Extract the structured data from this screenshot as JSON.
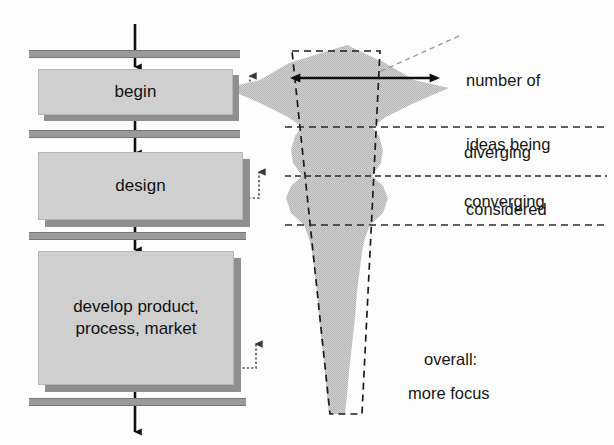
{
  "diagram": {
    "background_color": "#fdfdfd",
    "ink_color": "#1a1a1a",
    "fill_gray": "#cfcfcf",
    "bar_gray": "#9a9a9a",
    "shadow_gray": "#8f8f8f"
  },
  "process": {
    "stages": [
      {
        "id": "begin",
        "label": "begin"
      },
      {
        "id": "design",
        "label": "design"
      },
      {
        "id": "develop",
        "label": "develop product,\nprocess, market",
        "line1": "develop product,",
        "line2": "process, market"
      }
    ],
    "gates": [
      {
        "id": "gate-1"
      },
      {
        "id": "gate-2"
      },
      {
        "id": "gate-3"
      },
      {
        "id": "gate-4"
      }
    ],
    "flow_arrows": [
      {
        "id": "arrow-into-begin"
      },
      {
        "id": "arrow-begin-to-design"
      },
      {
        "id": "arrow-design-to-develop"
      },
      {
        "id": "arrow-out-of-develop"
      }
    ],
    "feedback_loops": [
      {
        "id": "feedback-begin"
      },
      {
        "id": "feedback-design"
      },
      {
        "id": "feedback-develop"
      }
    ]
  },
  "funnel": {
    "measure_arrow_label": "number of\nideas being\nconsidered",
    "callout": {
      "line1": "number of",
      "line2": "ideas being",
      "line3": "considered"
    },
    "phase_labels": [
      {
        "id": "diverging",
        "text": "diverging"
      },
      {
        "id": "converging",
        "text": "converging"
      }
    ],
    "summary": {
      "line1": "overall:",
      "line2": "more focus"
    },
    "dividers": [
      {
        "id": "divider-1",
        "y": 127
      },
      {
        "id": "divider-2",
        "y": 176
      },
      {
        "id": "divider-3",
        "y": 225
      }
    ]
  }
}
